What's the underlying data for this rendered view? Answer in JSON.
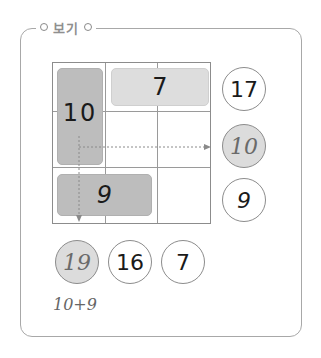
{
  "title": "보기",
  "grid": {
    "rows": 3,
    "cols": 3,
    "blocks": [
      {
        "label": "10",
        "shade": "dark",
        "span": "col1 rows1-2"
      },
      {
        "label": "7",
        "shade": "light",
        "span": "row1 cols2-3"
      },
      {
        "label": "9",
        "shade": "dark",
        "span": "row3 cols1-2"
      }
    ]
  },
  "row_sums": [
    {
      "value": "17",
      "highlighted": false
    },
    {
      "value": "10",
      "highlighted": true
    },
    {
      "value": "9",
      "highlighted": false
    }
  ],
  "col_sums": [
    {
      "value": "19",
      "highlighted": true
    },
    {
      "value": "16",
      "highlighted": false
    },
    {
      "value": "7",
      "highlighted": false
    }
  ],
  "note": "10+9",
  "colors": {
    "dark_block": "#bdbdbd",
    "light_block": "#dddddd",
    "highlight_circle": "#dcdcdc",
    "border": "#8c8c8c"
  }
}
